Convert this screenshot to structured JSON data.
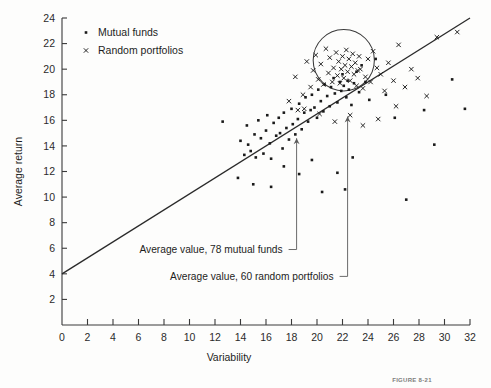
{
  "figure": {
    "caption": "FIGURE 8-21",
    "background_color": "#fdfdfc",
    "ink_color": "#1a1a1a"
  },
  "chart_data": {
    "type": "scatter",
    "title": "",
    "xlabel": "Variability",
    "ylabel": "Average return",
    "xlim": [
      0,
      32
    ],
    "ylim": [
      0,
      24
    ],
    "xticks": [
      0,
      2,
      4,
      6,
      8,
      10,
      12,
      14,
      16,
      18,
      20,
      22,
      24,
      26,
      28,
      30,
      32
    ],
    "yticks": [
      2,
      4,
      6,
      8,
      10,
      12,
      14,
      16,
      18,
      20,
      22,
      24
    ],
    "grid": false,
    "legend_position": "top-left-inside",
    "legend": [
      {
        "label": "Mutual funds",
        "marker": "dot"
      },
      {
        "label": "Random portfolios",
        "marker": "x"
      }
    ],
    "regression_line": {
      "label": "market line",
      "x": [
        0,
        32
      ],
      "y": [
        4.0,
        24.0
      ],
      "intercept": 4.0,
      "slope": 0.625
    },
    "highlight_circle": {
      "label": "cluster highlight",
      "center_x": 22.1,
      "center_y": 20.7,
      "radius_x": 2.4,
      "radius_y": 2.4
    },
    "annotations": [
      {
        "text": "Average value, 78 mutual funds",
        "points_to_x": 18.4,
        "points_to_y": 14.6,
        "text_x": 5.3,
        "text_y": 5.9
      },
      {
        "text": "Average value, 60 random portfolios",
        "points_to_x": 22.4,
        "points_to_y": 16.3,
        "text_x": 6.5,
        "text_y": 3.8
      }
    ],
    "series": [
      {
        "name": "Mutual funds",
        "marker": "dot",
        "count": 78,
        "points": [
          [
            12.6,
            15.9
          ],
          [
            14.0,
            14.4
          ],
          [
            14.3,
            13.3
          ],
          [
            14.5,
            15.6
          ],
          [
            14.6,
            14.1
          ],
          [
            14.8,
            13.6
          ],
          [
            15.1,
            14.9
          ],
          [
            15.2,
            13.1
          ],
          [
            15.4,
            16.0
          ],
          [
            15.6,
            14.6
          ],
          [
            15.8,
            13.4
          ],
          [
            16.0,
            15.2
          ],
          [
            16.1,
            16.4
          ],
          [
            16.3,
            14.2
          ],
          [
            16.4,
            13.0
          ],
          [
            16.6,
            15.8
          ],
          [
            16.8,
            14.8
          ],
          [
            17.0,
            16.2
          ],
          [
            17.1,
            15.0
          ],
          [
            17.3,
            13.8
          ],
          [
            17.4,
            16.6
          ],
          [
            17.6,
            15.4
          ],
          [
            17.8,
            14.5
          ],
          [
            18.0,
            16.9
          ],
          [
            18.1,
            15.7
          ],
          [
            18.3,
            14.9
          ],
          [
            18.5,
            16.1
          ],
          [
            18.6,
            17.3
          ],
          [
            18.8,
            15.3
          ],
          [
            19.0,
            16.6
          ],
          [
            19.1,
            17.8
          ],
          [
            19.3,
            15.9
          ],
          [
            19.5,
            16.8
          ],
          [
            19.6,
            18.0
          ],
          [
            19.8,
            17.0
          ],
          [
            20.0,
            16.2
          ],
          [
            20.1,
            18.4
          ],
          [
            20.3,
            17.5
          ],
          [
            20.5,
            16.7
          ],
          [
            20.6,
            18.8
          ],
          [
            20.8,
            17.9
          ],
          [
            21.0,
            17.1
          ],
          [
            21.1,
            18.6
          ],
          [
            21.3,
            19.3
          ],
          [
            21.4,
            18.1
          ],
          [
            21.6,
            17.4
          ],
          [
            21.8,
            19.0
          ],
          [
            21.9,
            18.3
          ],
          [
            22.0,
            19.6
          ],
          [
            22.1,
            18.7
          ],
          [
            22.3,
            17.8
          ],
          [
            22.4,
            19.1
          ],
          [
            22.5,
            18.4
          ],
          [
            22.7,
            17.2
          ],
          [
            22.9,
            18.9
          ],
          [
            23.1,
            19.8
          ],
          [
            23.3,
            18.2
          ],
          [
            23.5,
            20.3
          ],
          [
            23.8,
            19.0
          ],
          [
            24.1,
            17.6
          ],
          [
            13.8,
            11.5
          ],
          [
            15.0,
            11.0
          ],
          [
            16.4,
            10.8
          ],
          [
            17.4,
            12.4
          ],
          [
            18.6,
            11.8
          ],
          [
            19.6,
            12.9
          ],
          [
            20.4,
            10.4
          ],
          [
            21.6,
            11.9
          ],
          [
            22.2,
            10.6
          ],
          [
            22.8,
            13.1
          ],
          [
            24.6,
            20.8
          ],
          [
            25.4,
            18.0
          ],
          [
            26.1,
            16.2
          ],
          [
            27.0,
            9.8
          ],
          [
            28.4,
            16.8
          ],
          [
            29.2,
            14.1
          ],
          [
            30.6,
            19.2
          ],
          [
            31.6,
            16.9
          ]
        ]
      },
      {
        "name": "Random portfolios",
        "marker": "x",
        "count": 60,
        "points": [
          [
            18.3,
            19.4
          ],
          [
            18.9,
            18.0
          ],
          [
            19.2,
            20.6
          ],
          [
            19.5,
            18.6
          ],
          [
            19.7,
            19.9
          ],
          [
            19.9,
            21.1
          ],
          [
            20.1,
            19.2
          ],
          [
            20.3,
            20.4
          ],
          [
            20.5,
            18.8
          ],
          [
            20.7,
            21.6
          ],
          [
            20.9,
            19.7
          ],
          [
            21.0,
            20.9
          ],
          [
            21.2,
            19.0
          ],
          [
            21.3,
            20.1
          ],
          [
            21.5,
            21.3
          ],
          [
            21.6,
            19.5
          ],
          [
            21.7,
            20.6
          ],
          [
            21.8,
            18.9
          ],
          [
            21.9,
            20.0
          ],
          [
            22.0,
            21.0
          ],
          [
            22.1,
            19.3
          ],
          [
            22.2,
            20.3
          ],
          [
            22.3,
            21.5
          ],
          [
            22.4,
            19.8
          ],
          [
            22.5,
            20.8
          ],
          [
            22.6,
            19.1
          ],
          [
            22.7,
            20.2
          ],
          [
            22.8,
            21.2
          ],
          [
            22.9,
            19.6
          ],
          [
            23.0,
            20.5
          ],
          [
            23.1,
            18.7
          ],
          [
            23.2,
            19.9
          ],
          [
            23.3,
            21.0
          ],
          [
            23.4,
            20.0
          ],
          [
            23.6,
            18.5
          ],
          [
            23.8,
            19.4
          ],
          [
            24.0,
            20.8
          ],
          [
            24.2,
            19.0
          ],
          [
            24.4,
            21.4
          ],
          [
            24.7,
            20.1
          ],
          [
            25.0,
            19.6
          ],
          [
            25.3,
            18.3
          ],
          [
            25.6,
            20.5
          ],
          [
            26.0,
            19.1
          ],
          [
            26.4,
            21.9
          ],
          [
            26.9,
            18.6
          ],
          [
            27.4,
            20.0
          ],
          [
            27.9,
            19.3
          ],
          [
            28.6,
            17.9
          ],
          [
            29.4,
            22.5
          ],
          [
            19.0,
            16.9
          ],
          [
            20.2,
            16.5
          ],
          [
            21.4,
            15.9
          ],
          [
            22.6,
            16.4
          ],
          [
            23.6,
            15.6
          ],
          [
            24.8,
            16.1
          ],
          [
            26.2,
            17.1
          ],
          [
            17.8,
            17.5
          ],
          [
            18.5,
            16.8
          ],
          [
            31.0,
            22.9
          ]
        ]
      }
    ]
  }
}
